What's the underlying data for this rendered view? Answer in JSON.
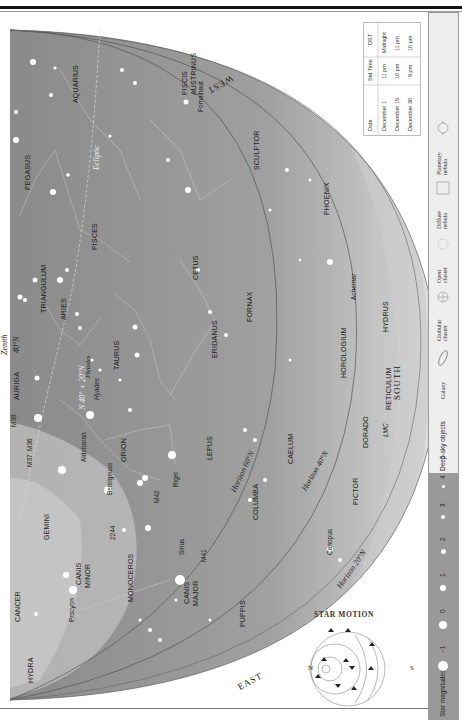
{
  "header": {
    "text": "THE STARS AND DEEP-SKY OBJECTS 249"
  },
  "chart": {
    "directions": {
      "west": "WEST",
      "east": "EAST",
      "south": "SOUTH"
    },
    "constellations": [
      {
        "name": "PEGASUS"
      },
      {
        "name": "AQUARIUS"
      },
      {
        "name": "PISCIS"
      },
      {
        "name": "AUSTRINUS"
      },
      {
        "name": "PISCES"
      },
      {
        "name": "TRIANGULUM"
      },
      {
        "name": "ARIES"
      },
      {
        "name": "CETUS"
      },
      {
        "name": "SCULPTOR"
      },
      {
        "name": "PHOENIX"
      },
      {
        "name": "FORNAX"
      },
      {
        "name": "ERIDANUS"
      },
      {
        "name": "TAURUS"
      },
      {
        "name": "AURIGA"
      },
      {
        "name": "ORION"
      },
      {
        "name": "LEPUS"
      },
      {
        "name": "CAELUM"
      },
      {
        "name": "HOROLOGIUM"
      },
      {
        "name": "HYDRUS"
      },
      {
        "name": "RETICULUM"
      },
      {
        "name": "DORADO"
      },
      {
        "name": "PICTOR"
      },
      {
        "name": "COLUMBA"
      },
      {
        "name": "GEMINI"
      },
      {
        "name": "MONOCEROS"
      },
      {
        "name": "CANIS"
      },
      {
        "name": "MINOR"
      },
      {
        "name": "CANIS"
      },
      {
        "name": "MAJOR"
      },
      {
        "name": "CANCER"
      },
      {
        "name": "HYDRA"
      },
      {
        "name": "PUPPIS"
      }
    ],
    "stars": [
      {
        "name": "Fomalhaut"
      },
      {
        "name": "Achernar"
      },
      {
        "name": "Aldebaran"
      },
      {
        "name": "Betelgeuse"
      },
      {
        "name": "Rigel"
      },
      {
        "name": "Sirius"
      },
      {
        "name": "Procyon"
      },
      {
        "name": "Canopus"
      }
    ],
    "objects": [
      {
        "name": "Pleiades"
      },
      {
        "name": "Hyades"
      },
      {
        "name": "M38"
      },
      {
        "name": "M37"
      },
      {
        "name": "M36"
      },
      {
        "name": "M42"
      },
      {
        "name": "2244"
      },
      {
        "name": "M41"
      },
      {
        "name": "LMC"
      }
    ],
    "lines": {
      "ecliptic": "Ecliptic",
      "zenith": "Zenith",
      "zenith_lat": "40°N",
      "zenith_lat2": "20°N",
      "zenith_combo": "N 40° + 20°N",
      "horizon_60": "Horizon 60°N",
      "horizon_40": "Horizon 40°N",
      "horizon_20": "Horizon 20°N"
    },
    "star_motion": {
      "title": "STAR MOTION",
      "left": "N",
      "right": "S"
    }
  },
  "time_table": {
    "headers": [
      "Date",
      "Std Time",
      "DST"
    ],
    "rows": [
      [
        "December 1",
        "11 pm",
        "Midnight"
      ],
      [
        "December 15",
        "10 pm",
        "11 pm"
      ],
      [
        "December 30",
        "9 pm",
        "10 pm"
      ]
    ]
  },
  "legend": {
    "magnitudes_label": "Star magnitudes",
    "magnitudes": [
      "−1",
      "0",
      "1",
      "2",
      "3",
      "4",
      "5"
    ],
    "deep_sky_label": "Deep-sky objects",
    "deep_sky": [
      {
        "label": "Galaxy",
        "icon": "galaxy-icon"
      },
      {
        "label": "Globular cluster",
        "icon": "globular-cluster-icon"
      },
      {
        "label": "Open cluster",
        "icon": "open-cluster-icon"
      },
      {
        "label": "Diffuse nebula",
        "icon": "diffuse-nebula-icon"
      },
      {
        "label": "Planetary nebula",
        "icon": "planetary-nebula-icon"
      }
    ]
  },
  "colors": {
    "sky_dark": "#8e8e8e",
    "sky_mid": "#a9a9a9",
    "sky_light": "#cfcfcf",
    "legend_bar": "#9a9a9a"
  }
}
